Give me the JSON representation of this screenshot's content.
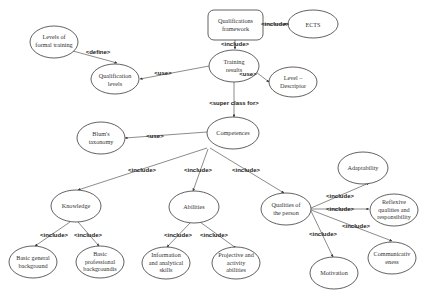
{
  "diagram": {
    "nodes": {
      "qualifications_framework": {
        "lines": [
          "Qualifications",
          "framework"
        ]
      },
      "ects": {
        "lines": [
          "ECTS"
        ]
      },
      "levels_formal_training": {
        "lines": [
          "Levels of",
          "formal training"
        ]
      },
      "training_results": {
        "lines": [
          "Training",
          "results"
        ]
      },
      "qualification_levels": {
        "lines": [
          "Qualification",
          "levels"
        ]
      },
      "level_descriptor": {
        "lines": [
          "Level –",
          "Descriptor"
        ]
      },
      "competences": {
        "lines": [
          "Competences"
        ]
      },
      "blums_taxonomy": {
        "lines": [
          "Blum's",
          "taxonomy"
        ]
      },
      "knowledge": {
        "lines": [
          "Knowledge"
        ]
      },
      "abilities": {
        "lines": [
          "Abilities"
        ]
      },
      "qualities_person": {
        "lines": [
          "Qualities of",
          "the person"
        ]
      },
      "adaptability": {
        "lines": [
          "Adaptability"
        ]
      },
      "reflexive": {
        "lines": [
          "Reflexive",
          "qualities and",
          "responsibility"
        ]
      },
      "communicativeness": {
        "lines": [
          "Communicativ",
          "eness"
        ]
      },
      "motivation": {
        "lines": [
          "Motivation"
        ]
      },
      "basic_general": {
        "lines": [
          "Basic general",
          "background"
        ]
      },
      "basic_professional": {
        "lines": [
          "Basic",
          "professional",
          "backgroundis"
        ]
      },
      "info_analytical": {
        "lines": [
          "Information",
          "and analytical",
          "skills"
        ]
      },
      "projective_activity": {
        "lines": [
          "Projective and",
          "activity",
          "abilities"
        ]
      }
    },
    "edge_labels": {
      "qf_ects": "<include>",
      "qf_tr": "<include>",
      "lft_ql": "<define>",
      "tr_ql": "<use>",
      "tr_ld": "<use>",
      "tr_comp": "<super class for>",
      "comp_blum": "<use>",
      "comp_know": "<include>",
      "comp_abil": "<include>",
      "comp_qual": "<include>",
      "know_bg": "<include>",
      "know_bp": "<include>",
      "abil_info": "<include>",
      "abil_proj": "<include>",
      "qual_adapt": "<include>",
      "qual_refl": "<include>",
      "qual_comm": "<include>",
      "qual_motiv": "<include>"
    }
  }
}
